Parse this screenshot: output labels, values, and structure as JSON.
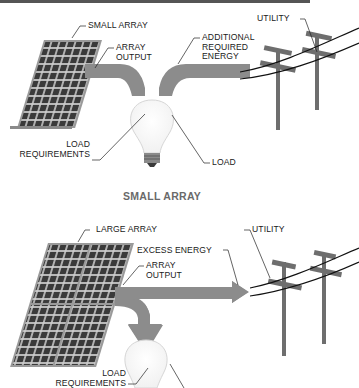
{
  "diagram": {
    "panels": [
      {
        "id": "small-array",
        "caption": "SMALL ARRAY",
        "labels": {
          "array": "SMALL ARRAY",
          "array_output": "ARRAY\nOUTPUT",
          "additional_energy": "ADDITIONAL\nREQUIRED\nENERGY",
          "utility": "UTILITY",
          "load_requirements": "LOAD\nREQUIREMENTS",
          "load": "LOAD"
        }
      },
      {
        "id": "large-array",
        "caption": "LARGE ARRAY",
        "labels": {
          "array": "LARGE ARRAY",
          "array_output": "ARRAY\nOUTPUT",
          "excess_energy": "EXCESS ENERGY",
          "utility": "UTILITY",
          "load_requirements": "LOAD\nREQUIREMENTS",
          "load": "LOAD"
        }
      }
    ],
    "colors": {
      "panel_cell": "#3a3a3a",
      "panel_frame": "#8a8a8a",
      "arrow": "#8c8c8c",
      "pole": "#6e6e6e",
      "wire": "#111111",
      "bulb_outline": "#d6d6d6",
      "caption": "#6a6a6a"
    }
  }
}
